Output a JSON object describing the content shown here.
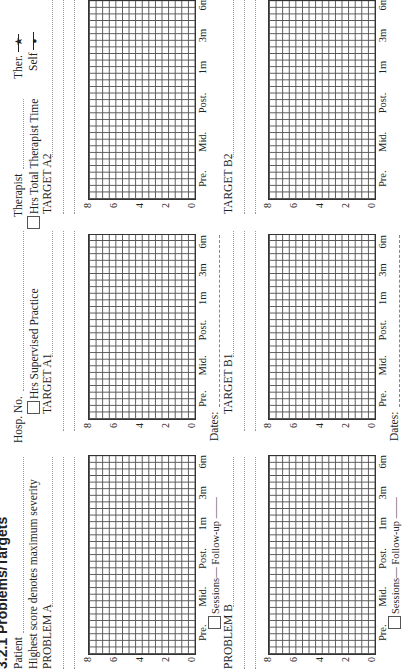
{
  "title": "3.2.1 Problems/Targets",
  "header": {
    "patient_label": "Patient",
    "hosp_no_label": "Hosp. No.",
    "therapist_label": "Therapist",
    "note": "Highest score denotes maximum severity",
    "supervised_practice_label": "Hrs Supervised Practice",
    "total_therapist_time_label": "Hrs Total Therapist Time"
  },
  "legend": {
    "therapist": "Ther.",
    "therapist_symbol": "★",
    "self": "Self",
    "self_symbol": "●"
  },
  "axis": {
    "y_ticks": [
      "8",
      "6",
      "4",
      "2",
      "0"
    ],
    "x_labels": [
      "Pre.",
      "Mid.",
      "Post.",
      "1m",
      "3m",
      "6m"
    ],
    "sessions_label": "Sessions",
    "followup_label": "Follow-up",
    "dates_label": "Dates:"
  },
  "panels": [
    {
      "id": "problem-a",
      "label": "PROBLEM A"
    },
    {
      "id": "target-a1",
      "label": "TARGET A1"
    },
    {
      "id": "target-a2",
      "label": "TARGET A2"
    },
    {
      "id": "problem-b",
      "label": "PROBLEM B"
    },
    {
      "id": "target-b1",
      "label": "TARGET B1"
    },
    {
      "id": "target-b2",
      "label": "TARGET B2"
    }
  ]
}
